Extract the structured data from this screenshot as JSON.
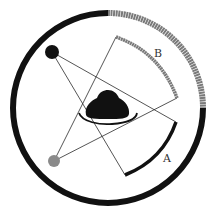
{
  "diagram": {
    "type": "optics-shadow-diagram",
    "colors": {
      "background": "#ffffff",
      "black": "#111111",
      "gray": "#7a7a7a",
      "line": "#2a2a2a"
    },
    "outer_ring": {
      "left_half_color": "black",
      "right_upper_quadrant_color": "gray"
    },
    "light_sources": [
      {
        "id": "black-source",
        "color": "black"
      },
      {
        "id": "gray-source",
        "color": "gray"
      }
    ],
    "object": {
      "name": "opaque-object"
    },
    "shadows": [
      {
        "label": "B",
        "color": "gray",
        "cast_by": "gray-source"
      },
      {
        "label": "A",
        "color": "black",
        "cast_by": "black-source"
      }
    ],
    "labels": {
      "shadow_b": "B",
      "shadow_a": "A"
    }
  }
}
